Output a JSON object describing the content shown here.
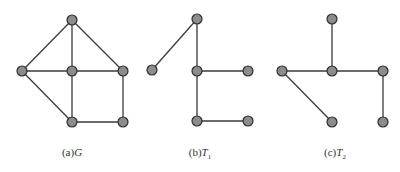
{
  "figures": [
    {
      "id": "G",
      "caption_prefix": "(a)",
      "caption_var": "G",
      "caption_sub": "",
      "nodes": [
        [
          72,
          20
        ],
        [
          22,
          71
        ],
        [
          72,
          71
        ],
        [
          123,
          71
        ],
        [
          72,
          122
        ],
        [
          123,
          122
        ]
      ],
      "edges": [
        [
          0,
          1
        ],
        [
          0,
          2
        ],
        [
          0,
          3
        ],
        [
          1,
          2
        ],
        [
          2,
          3
        ],
        [
          1,
          4
        ],
        [
          2,
          4
        ],
        [
          3,
          5
        ],
        [
          4,
          5
        ]
      ]
    },
    {
      "id": "T1",
      "caption_prefix": "(b)",
      "caption_var": "T",
      "caption_sub": "1",
      "nodes": [
        [
          197,
          19
        ],
        [
          152,
          70
        ],
        [
          197,
          71
        ],
        [
          248,
          71
        ],
        [
          197,
          121
        ],
        [
          248,
          121
        ]
      ],
      "edges": [
        [
          0,
          1
        ],
        [
          0,
          2
        ],
        [
          2,
          3
        ],
        [
          2,
          4
        ],
        [
          4,
          5
        ]
      ]
    },
    {
      "id": "T2",
      "caption_prefix": "(c)",
      "caption_var": "T",
      "caption_sub": "2",
      "nodes": [
        [
          332,
          19
        ],
        [
          282,
          71
        ],
        [
          332,
          71
        ],
        [
          383,
          71
        ],
        [
          332,
          122
        ],
        [
          383,
          122
        ]
      ],
      "edges": [
        [
          0,
          2
        ],
        [
          1,
          2
        ],
        [
          2,
          3
        ],
        [
          1,
          4
        ],
        [
          3,
          5
        ]
      ]
    }
  ],
  "style": {
    "node_fill": "#8c8c8c",
    "node_stroke": "#2e2e2e",
    "edge_color": "#3a3a3a",
    "node_radius": 5
  }
}
